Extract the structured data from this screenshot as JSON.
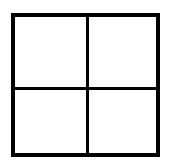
{
  "diagram": {
    "type": "2x2 grid",
    "rows": 2,
    "columns": 2,
    "cells": [
      {
        "row": 0,
        "col": 0,
        "label": ""
      },
      {
        "row": 0,
        "col": 1,
        "label": ""
      },
      {
        "row": 1,
        "col": 0,
        "label": ""
      },
      {
        "row": 1,
        "col": 1,
        "label": ""
      }
    ],
    "line_color": "#000000",
    "fill_color": "#ffffff"
  }
}
